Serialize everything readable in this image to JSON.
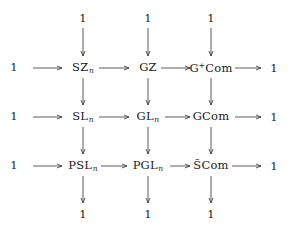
{
  "diagram": {
    "type": "commutative-diagram",
    "top_row": [
      "1",
      "1",
      "1"
    ],
    "bottom_row": [
      "1",
      "1",
      "1"
    ],
    "rows": [
      {
        "left": "1",
        "nodes": [
          {
            "base": "SZ",
            "sub": "n",
            "sup": ""
          },
          {
            "base": "GZ",
            "sub": "",
            "sup": ""
          },
          {
            "base": "G",
            "sup": "+",
            "rest": "Com"
          }
        ],
        "right": "1"
      },
      {
        "left": "1",
        "nodes": [
          {
            "base": "SL",
            "sub": "n",
            "sup": ""
          },
          {
            "base": "GL",
            "sub": "n",
            "sup": ""
          },
          {
            "base": "GCom",
            "sub": "",
            "sup": ""
          }
        ],
        "right": "1"
      },
      {
        "left": "1",
        "nodes": [
          {
            "base": "PSL",
            "sub": "n",
            "sup": ""
          },
          {
            "base": "PGL",
            "sub": "n",
            "sup": ""
          },
          {
            "base": "S̃Com",
            "sub": "",
            "sup": ""
          }
        ],
        "right": "1"
      }
    ],
    "arrows": {
      "horizontal_per_row": 4,
      "vertical_per_column": 4,
      "direction_horizontal": "right",
      "direction_vertical": "down"
    }
  }
}
